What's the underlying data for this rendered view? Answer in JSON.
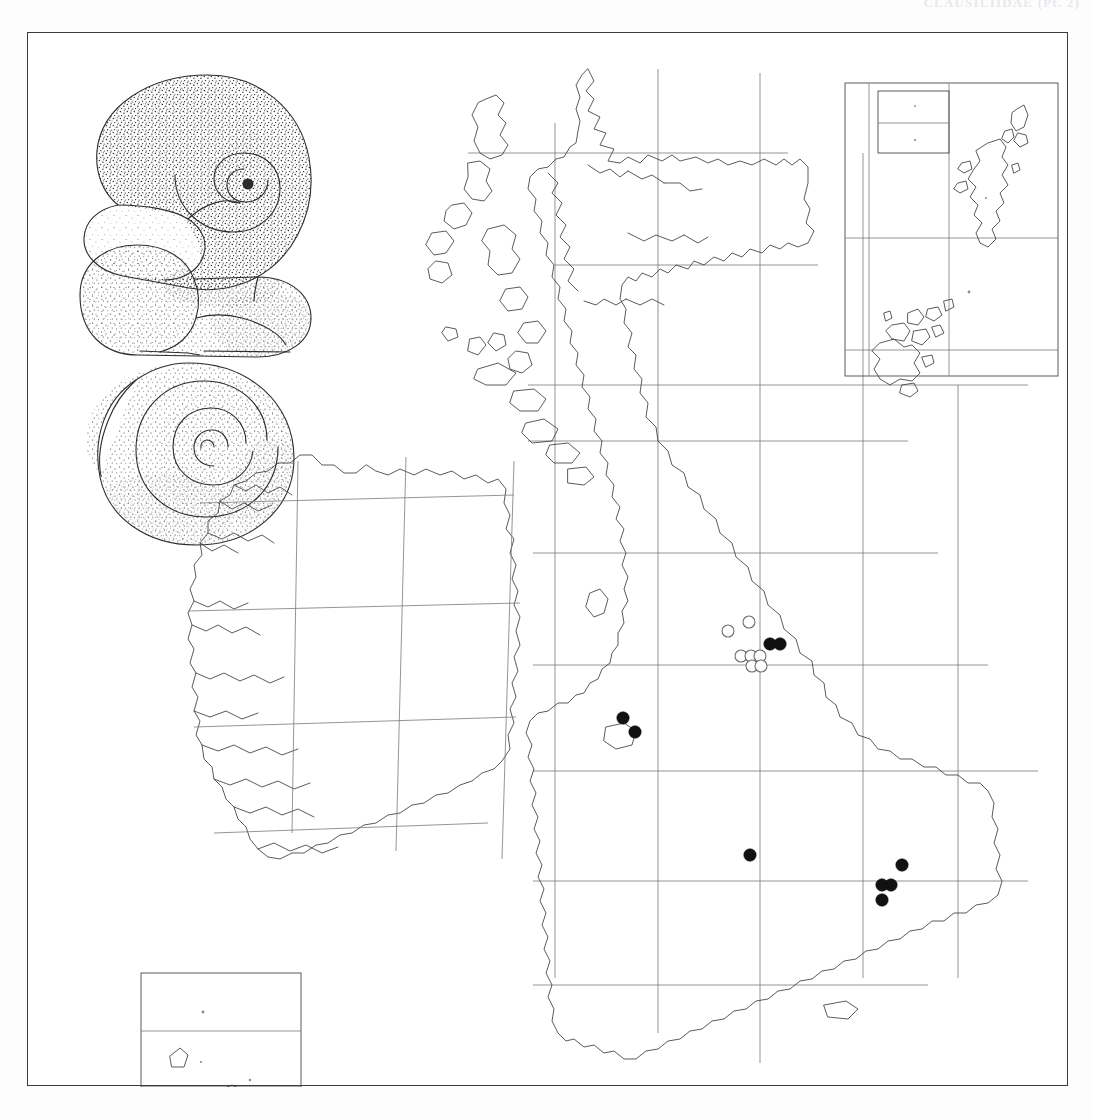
{
  "page": {
    "running_head": "CLAUSILIIDAE  (Pt. 2)",
    "width": 1094,
    "height": 1120
  },
  "plate": {
    "frame_label": "distribution-plate-frame",
    "background_color": "#ffffff",
    "border_color": "#3a3a3a"
  },
  "illustration": {
    "title": "shell-illustration-group",
    "views": [
      {
        "name": "apertural-view",
        "label": "Apertural view of shell"
      },
      {
        "name": "basal-view",
        "label": "Basal / aperture-on view of shell"
      },
      {
        "name": "spiral-view",
        "label": "Upper spiral view of shell"
      }
    ],
    "style": "stippled line drawing",
    "ink_color": "#2c2c2c"
  },
  "map": {
    "name": "british-isles-distribution-map",
    "projection_note": "Ordnance Survey national grid, 100 km squares",
    "regions": [
      {
        "name": "great-britain",
        "label": "Great Britain"
      },
      {
        "name": "ireland",
        "label": "Ireland"
      }
    ],
    "insets": [
      {
        "name": "orkney-shetland-inset",
        "label": "Orkney and Shetland",
        "position": "top-right"
      },
      {
        "name": "channel-islands-inset",
        "label": "Channel Islands",
        "position": "bottom-left"
      }
    ],
    "grid": {
      "color": "#7a7a7a",
      "spacing_label": "100 km",
      "visible": true
    }
  },
  "symbols": {
    "filled_circle": {
      "name": "record-post-1965",
      "label": "Filled circle — recent record",
      "color": "#111111",
      "count": 9
    },
    "open_circle": {
      "name": "record-pre-1965",
      "label": "Open circle — old record",
      "color": "#ffffff",
      "stroke": "#6e6e6e",
      "count": 7
    }
  },
  "chart_data": {
    "type": "scatter",
    "xlabel": "National grid easting (px)",
    "ylabel": "National grid northing (px)",
    "legend": [
      "filled circle = recent record",
      "open circle = old record"
    ],
    "series": [
      {
        "name": "filled",
        "marker": "filled-circle",
        "points": [
          [
            769,
            643
          ],
          [
            779,
            643
          ],
          [
            622,
            717
          ],
          [
            634,
            731
          ],
          [
            749,
            854
          ],
          [
            901,
            864
          ],
          [
            881,
            884
          ],
          [
            890,
            884
          ],
          [
            881,
            899
          ]
        ]
      },
      {
        "name": "open",
        "marker": "open-circle",
        "points": [
          [
            748,
            621
          ],
          [
            727,
            630
          ],
          [
            740,
            655
          ],
          [
            750,
            655
          ],
          [
            759,
            655
          ],
          [
            751,
            665
          ],
          [
            760,
            665
          ]
        ]
      }
    ],
    "grid": true,
    "legend_position": "none"
  }
}
